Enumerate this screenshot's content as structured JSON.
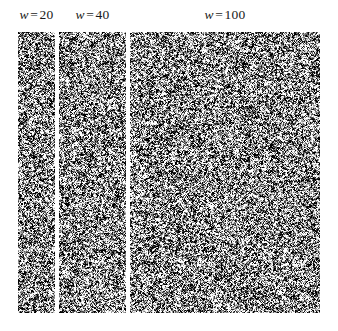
{
  "figure": {
    "width": 338,
    "height": 331,
    "background_color": "#ffffff",
    "kind": "multi-panel-noise-texture-figure"
  },
  "chart_data": {
    "type": "heatmap",
    "title": "",
    "subtitle": "",
    "xlabel": "",
    "ylabel": "",
    "grid": false,
    "legend_position": "none",
    "panels": [
      {
        "label": "w = 20",
        "label_variable": "w",
        "label_operator": "=",
        "label_value": "20",
        "w": 20,
        "px": {
          "x": 18,
          "y": 32,
          "width": 37,
          "height": 281
        },
        "noise": {
          "mean_gray": 140,
          "contrast": 115,
          "cell": 1,
          "seed": 2001
        }
      },
      {
        "label": "w = 40",
        "label_variable": "w",
        "label_operator": "=",
        "label_value": "40",
        "w": 40,
        "px": {
          "x": 59,
          "y": 32,
          "width": 67,
          "height": 281
        },
        "noise": {
          "mean_gray": 140,
          "contrast": 115,
          "cell": 1,
          "seed": 4002
        }
      },
      {
        "label": "w = 100",
        "label_variable": "w",
        "label_operator": "=",
        "label_value": "100",
        "w": 100,
        "px": {
          "x": 130,
          "y": 32,
          "width": 190,
          "height": 281
        },
        "noise": {
          "mean_gray": 140,
          "contrast": 115,
          "cell": 1,
          "seed": 10003
        }
      }
    ],
    "categories": [
      "w = 20",
      "w = 40",
      "w = 100"
    ],
    "values": [
      20,
      40,
      100
    ],
    "panel_pixel_widths": [
      37,
      67,
      190
    ],
    "panel_pixel_height": 281,
    "colors": {
      "background": "#ffffff",
      "label_text": "#1a1a1a",
      "noise_mean": "#8c8c8c",
      "noise_light": "#f2f2f2",
      "noise_dark": "#2e2e2e"
    }
  }
}
